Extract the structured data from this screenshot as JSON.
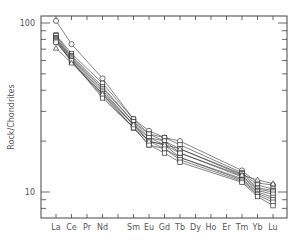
{
  "chart_data": {
    "type": "line",
    "title": "",
    "xlabel": "",
    "ylabel": "Rock/Chondrites",
    "yscale": "log",
    "ylim": [
      7,
      110
    ],
    "y_ticks": [
      {
        "value": 10,
        "label": "10"
      },
      {
        "value": 100,
        "label": "100"
      }
    ],
    "grid": false,
    "legend": null,
    "categories": [
      "La",
      "Ce",
      "Pr",
      "Nd",
      "Pm",
      "Sm",
      "Eu",
      "Gd",
      "Tb",
      "Dy",
      "Ho",
      "Er",
      "Tm",
      "Yb",
      "Lu"
    ],
    "category_labels": [
      "La",
      "Ce",
      "Pr",
      "Nd",
      "",
      "Sm",
      "Eu",
      "Gd",
      "Tb",
      "Dy",
      "Ho",
      "Er",
      "Tm",
      "Yb",
      "Lu"
    ],
    "plotted_elements": [
      "La",
      "Ce",
      "Nd",
      "Sm",
      "Eu",
      "Gd",
      "Tb",
      "Tm",
      "Yb",
      "Lu"
    ],
    "series": [
      {
        "name": "s1",
        "marker": "circle",
        "values": {
          "La": 103,
          "Ce": 75,
          "Nd": 47,
          "Sm": 27,
          "Eu": 23,
          "Gd": 21,
          "Tb": 20,
          "Tm": 13.4,
          "Yb": 11.3,
          "Lu": 11.0
        }
      },
      {
        "name": "s2",
        "marker": "square",
        "values": {
          "La": 85,
          "Ce": 66,
          "Nd": 44,
          "Sm": 27,
          "Eu": 22,
          "Gd": 21,
          "Tb": 19,
          "Tm": 13.0,
          "Yb": 11.0,
          "Lu": 10.4
        }
      },
      {
        "name": "s3",
        "marker": "square",
        "values": {
          "La": 84,
          "Ce": 64,
          "Nd": 42,
          "Sm": 26,
          "Eu": 22,
          "Gd": 20,
          "Tb": 18,
          "Tm": 12.8,
          "Yb": 10.6,
          "Lu": 10.2
        }
      },
      {
        "name": "s4",
        "marker": "square",
        "values": {
          "La": 82,
          "Ce": 63,
          "Nd": 41,
          "Sm": 26,
          "Eu": 21,
          "Gd": 20,
          "Tb": 17,
          "Tm": 12.5,
          "Yb": 10.4,
          "Lu": 10.0
        }
      },
      {
        "name": "s5",
        "marker": "square",
        "values": {
          "La": 81,
          "Ce": 62,
          "Nd": 40,
          "Sm": 25,
          "Eu": 21,
          "Gd": 19,
          "Tb": 17,
          "Tm": 12.3,
          "Yb": 10.2,
          "Lu": 9.7
        }
      },
      {
        "name": "s6",
        "marker": "square",
        "values": {
          "La": 80,
          "Ce": 61,
          "Nd": 39,
          "Sm": 25,
          "Eu": 20,
          "Gd": 19,
          "Tb": 16,
          "Tm": 12.0,
          "Yb": 10.0,
          "Lu": 9.3
        }
      },
      {
        "name": "s7",
        "marker": "square",
        "values": {
          "La": 79,
          "Ce": 60,
          "Nd": 38,
          "Sm": 24,
          "Eu": 20,
          "Gd": 18,
          "Tb": 16,
          "Tm": 11.8,
          "Yb": 9.8,
          "Lu": 9.0
        }
      },
      {
        "name": "s8",
        "marker": "square",
        "values": {
          "La": 78,
          "Ce": 59,
          "Nd": 37,
          "Sm": 24,
          "Eu": 19,
          "Gd": 18,
          "Tb": 15.5,
          "Tm": 11.6,
          "Yb": 9.6,
          "Lu": 8.7
        }
      },
      {
        "name": "s9",
        "marker": "square",
        "values": {
          "La": 77,
          "Ce": 60,
          "Nd": 36,
          "Sm": 24,
          "Eu": 19,
          "Gd": 17,
          "Tb": 15,
          "Tm": 11.4,
          "Yb": 9.4,
          "Lu": 8.3
        }
      },
      {
        "name": "s10",
        "marker": "triangle",
        "values": {
          "La": 71,
          "Ce": 58,
          "Nd": 38,
          "Sm": 25,
          "Eu": 20,
          "Gd": 19,
          "Tb": 18,
          "Tm": 12.6,
          "Yb": 11.8,
          "Lu": 11.2
        }
      }
    ]
  }
}
